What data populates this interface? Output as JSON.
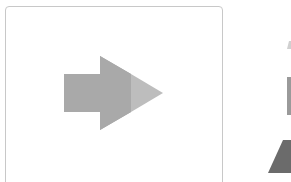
{
  "card": {
    "icon": "right-arrow-icon",
    "colors": {
      "border": "#c8c8c8",
      "arrow_main": "#a9a9a9",
      "arrow_tip": "#bdbdbd"
    }
  },
  "side_preview": {
    "icons": [
      "up-triangle-icon",
      "rectangle-icon",
      "triangle-icon"
    ],
    "colors": {
      "small_triangle": "#d0d0d0",
      "rectangle": "#9a9a9a",
      "large_triangle": "#6b6b6b"
    }
  }
}
